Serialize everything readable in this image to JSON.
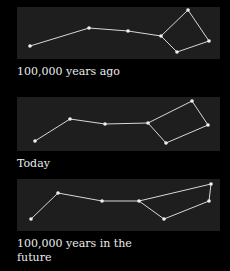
{
  "figure": {
    "background": "#000000",
    "panel_color": "#1e1e1e",
    "line_color": "#d8d8d8",
    "star_color": "#f0f0f0",
    "panels": [
      {
        "caption": "100,000 years ago",
        "stars": [
          [
            13,
            39
          ],
          [
            72,
            21
          ],
          [
            111,
            24
          ],
          [
            144,
            29
          ],
          [
            171,
            3
          ],
          [
            160,
            45
          ],
          [
            192,
            34
          ]
        ],
        "edges": [
          [
            0,
            1
          ],
          [
            1,
            2
          ],
          [
            2,
            3
          ],
          [
            3,
            4
          ],
          [
            4,
            6
          ],
          [
            6,
            5
          ],
          [
            5,
            3
          ]
        ]
      },
      {
        "caption": "Today",
        "stars": [
          [
            18,
            44
          ],
          [
            53,
            22
          ],
          [
            88,
            27
          ],
          [
            131,
            26
          ],
          [
            175,
            4
          ],
          [
            191,
            28
          ],
          [
            149,
            46
          ]
        ],
        "edges": [
          [
            0,
            1
          ],
          [
            1,
            2
          ],
          [
            2,
            3
          ],
          [
            3,
            4
          ],
          [
            4,
            5
          ],
          [
            5,
            6
          ],
          [
            6,
            3
          ]
        ]
      },
      {
        "caption": "100,000 years in the future",
        "stars": [
          [
            14,
            40
          ],
          [
            41,
            14
          ],
          [
            85,
            22
          ],
          [
            122,
            22
          ],
          [
            194,
            5
          ],
          [
            192,
            22
          ],
          [
            147,
            40
          ]
        ],
        "edges": [
          [
            0,
            1
          ],
          [
            1,
            2
          ],
          [
            2,
            3
          ],
          [
            3,
            4
          ],
          [
            4,
            5
          ],
          [
            5,
            6
          ],
          [
            6,
            3
          ]
        ]
      }
    ]
  }
}
